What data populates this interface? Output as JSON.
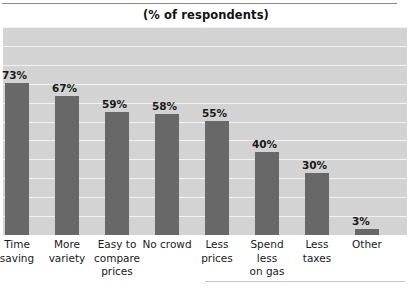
{
  "chart_data": {
    "type": "bar",
    "title": "(% of respondents)",
    "xlabel": "",
    "ylabel": "",
    "ylim": [
      0,
      100
    ],
    "grid": true,
    "legend": "none",
    "categories": [
      "Time saving",
      "More variety",
      "Easy to compare prices",
      "No crowd",
      "Less prices",
      "Spend less on gas",
      "Less taxes",
      "Other"
    ],
    "category_lines": [
      [
        "Time",
        "saving"
      ],
      [
        "More",
        "variety"
      ],
      [
        "Easy to",
        "compare",
        "prices"
      ],
      [
        "No crowd"
      ],
      [
        "Less",
        "prices"
      ],
      [
        "Spend",
        "less",
        "on gas"
      ],
      [
        "Less",
        "taxes"
      ],
      [
        "Other"
      ]
    ],
    "values": [
      73,
      67,
      59,
      58,
      55,
      40,
      30,
      3
    ],
    "value_labels": [
      "73%",
      "67%",
      "59%",
      "58%",
      "55%",
      "40%",
      "30%",
      "3%"
    ],
    "colors": {
      "bar": "#686868",
      "plot_background": "#d3d3d3",
      "gridline": "#f2f2f2",
      "page_background": "#ffffff",
      "text": "#1a1a1a",
      "rule": "#8a8a8a"
    },
    "gridline_count": 11
  }
}
